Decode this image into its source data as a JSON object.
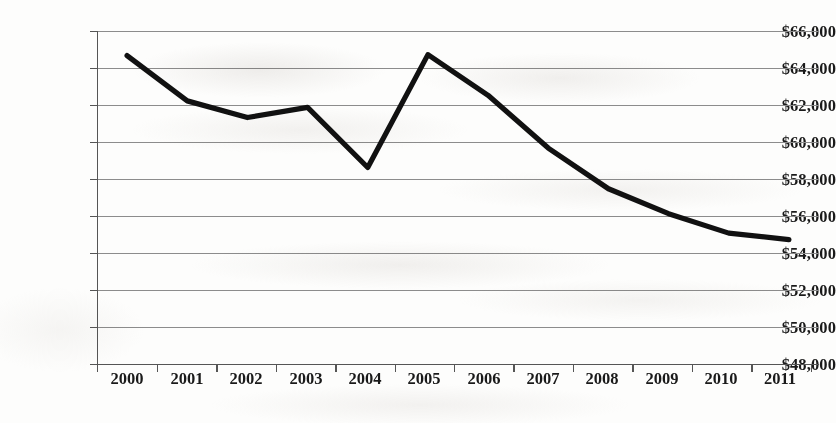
{
  "chart_data": {
    "type": "line",
    "title": "",
    "subtitle": "",
    "xlabel": "",
    "ylabel": "",
    "categories": [
      "2000",
      "2001",
      "2002",
      "2003",
      "2004",
      "2005",
      "2006",
      "2007",
      "2008",
      "2009",
      "2010",
      "2011"
    ],
    "values": [
      64700,
      62250,
      61350,
      61900,
      58650,
      64750,
      62550,
      59700,
      57500,
      56150,
      55100,
      54750
    ],
    "series": [
      {
        "name": "",
        "values": [
          64700,
          62250,
          61350,
          61900,
          58650,
          64750,
          62550,
          59700,
          57500,
          56150,
          55100,
          54750
        ]
      }
    ],
    "ylim": [
      48000,
      66000
    ],
    "ytick_step": 2000,
    "ytick_labels": [
      "$66,000",
      "$64,000",
      "$62,000",
      "$60,000",
      "$58,000",
      "$56,000",
      "$54,000",
      "$52,000",
      "$50,000",
      "$48,000"
    ],
    "ytick_values": [
      66000,
      64000,
      62000,
      60000,
      58000,
      56000,
      54000,
      52000,
      50000,
      48000
    ],
    "xtick_labels": [
      "2000",
      "2001",
      "2002",
      "2003",
      "2004",
      "2005",
      "2006",
      "2007",
      "2008",
      "2009",
      "2010",
      "2011"
    ],
    "grid": "horizontal",
    "legend": "none",
    "value_prefix": "$",
    "line_color": "#111111",
    "grid_color": "#8c8c8c",
    "axis_color": "#555555",
    "background_color": "#fdfdfc"
  }
}
